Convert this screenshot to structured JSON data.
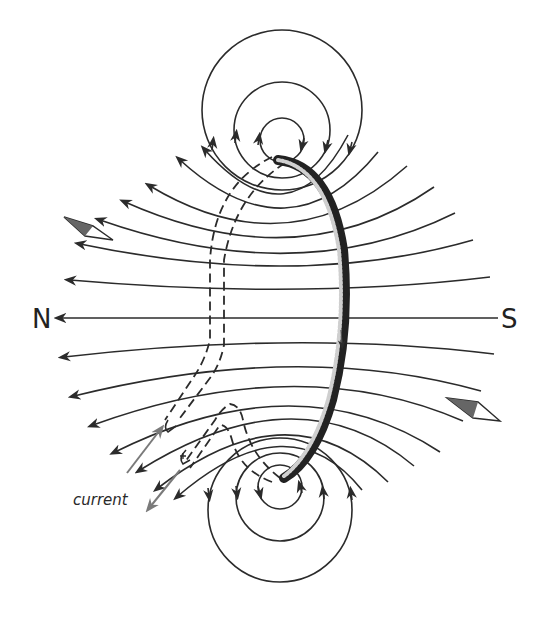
{
  "diagram": {
    "labels": {
      "north": "N",
      "south": "S",
      "current": "current"
    },
    "elements": {
      "loop": "wire-loop (front solid, back dashed)",
      "field_lines": "field lines point from S side to N side through loop center",
      "upper_wire_circles": 3,
      "lower_wire_circles": 4,
      "compass_needles": 2
    },
    "colors": {
      "line": "#2b2b2b",
      "current_arrow": "#7a7a7a",
      "needle_fill": "#666666",
      "background": "#ffffff"
    }
  }
}
